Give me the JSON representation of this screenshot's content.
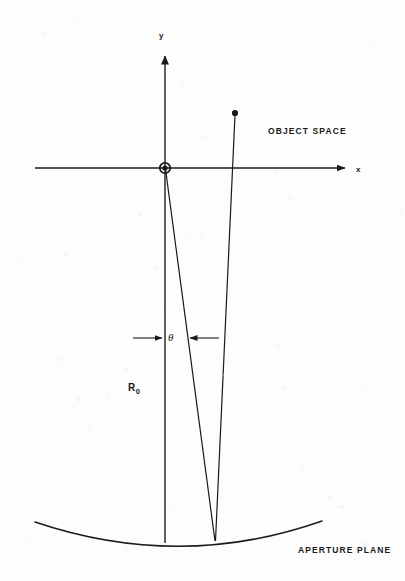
{
  "figure": {
    "background_color": "#fdfdfd",
    "ink_color": "#1a1a1a",
    "width": 405,
    "height": 581
  },
  "labels": {
    "object_space": "OBJECT SPACE",
    "aperture_plane": "APERTURE PLANE",
    "axis_y": "y",
    "axis_x": "x",
    "angle_theta": "θ",
    "radius_symbol": "R",
    "radius_subscript": "0"
  },
  "chart_data": {
    "type": "diagram-line",
    "coordinate_note": "pixel coordinates, origin top-left of 405x581 canvas",
    "axes": {
      "origin": {
        "x": 165,
        "y": 168
      },
      "x_axis": {
        "start": {
          "x": 35,
          "y": 168
        },
        "end": {
          "x": 350,
          "y": 168
        },
        "arrow": "end",
        "label": "x"
      },
      "y_axis": {
        "start": {
          "x": 165,
          "y": 50
        },
        "end": {
          "x": 165,
          "y": 541
        },
        "arrow": "start",
        "label": "y"
      }
    },
    "points": [
      {
        "name": "origin-marker",
        "x": 165,
        "y": 168,
        "style": "filled-circle-with-ring"
      },
      {
        "name": "object-point",
        "x": 235,
        "y": 113,
        "style": "filled-dot"
      },
      {
        "name": "convergence-point",
        "x": 215,
        "y": 540,
        "style": "implicit"
      }
    ],
    "rays": [
      {
        "name": "axis-ray",
        "from": {
          "x": 165,
          "y": 168
        },
        "to": {
          "x": 215,
          "y": 540
        }
      },
      {
        "name": "object-ray",
        "from": {
          "x": 235,
          "y": 113
        },
        "to": {
          "x": 215,
          "y": 540
        }
      },
      {
        "name": "optical-axis",
        "from": {
          "x": 165,
          "y": 168
        },
        "to": {
          "x": 165,
          "y": 541
        }
      }
    ],
    "aperture_curve": {
      "name": "aperture-plane-curve",
      "type": "shallow-upward-arc",
      "left_end": {
        "x": 35,
        "y": 522
      },
      "vertex": {
        "x": 180,
        "y": 546
      },
      "right_end": {
        "x": 322,
        "y": 521
      }
    },
    "angle_annotation": {
      "symbol": "θ",
      "symbol_position": {
        "x": 172,
        "y": 338
      },
      "left_arrow": {
        "from": {
          "x": 133,
          "y": 338
        },
        "to": {
          "x": 163,
          "y": 338
        }
      },
      "right_arrow": {
        "from": {
          "x": 217,
          "y": 338
        },
        "to": {
          "x": 188,
          "y": 338
        }
      },
      "between": [
        "optical-axis",
        "axis-ray"
      ]
    },
    "distance_annotation": {
      "symbol": "R0",
      "position": {
        "x": 133,
        "y": 390
      },
      "measures": "origin to aperture plane along optical axis"
    }
  }
}
